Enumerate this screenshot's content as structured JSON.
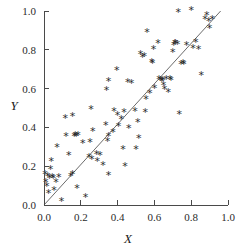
{
  "chart_data": {
    "type": "scatter",
    "title": "",
    "xlabel": "X",
    "ylabel": "Y",
    "xlim": [
      0.0,
      1.0
    ],
    "ylim": [
      0.0,
      1.0
    ],
    "grid": false,
    "legend": null,
    "marker_symbol": "*",
    "marker_color": "#2a2a2a",
    "xticks": [
      "0.0",
      "0.2",
      "0.4",
      "0.6",
      "0.8",
      "1.0"
    ],
    "xtick_values": [
      0.0,
      0.2,
      0.4,
      0.6,
      0.8,
      1.0
    ],
    "yticks": [
      "0.0",
      "0.2",
      "0.4",
      "0.6",
      "0.8",
      "1.0"
    ],
    "ytick_values": [
      0.0,
      0.2,
      0.4,
      0.6,
      0.8,
      1.0
    ],
    "fit_line": {
      "type": "line",
      "label": "",
      "color": "#5a5a5a",
      "x": [
        0.0,
        0.96
      ],
      "y": [
        0.0,
        1.0
      ],
      "slope": 1.04,
      "intercept": 0.0
    },
    "points": [
      [
        0.005,
        0.155
      ],
      [
        0.01,
        0.115
      ],
      [
        0.015,
        0.095
      ],
      [
        0.02,
        0.145
      ],
      [
        0.025,
        0.06
      ],
      [
        0.03,
        0.135
      ],
      [
        0.035,
        0.185
      ],
      [
        0.04,
        0.225
      ],
      [
        0.045,
        0.14
      ],
      [
        0.05,
        0.135
      ],
      [
        0.055,
        0.075
      ],
      [
        0.065,
        0.115
      ],
      [
        0.07,
        0.295
      ],
      [
        0.08,
        0.14
      ],
      [
        0.095,
        0.02
      ],
      [
        0.115,
        0.445
      ],
      [
        0.12,
        0.355
      ],
      [
        0.135,
        0.255
      ],
      [
        0.145,
        0.145
      ],
      [
        0.155,
        0.455
      ],
      [
        0.155,
        0.155
      ],
      [
        0.165,
        0.355
      ],
      [
        0.17,
        0.36
      ],
      [
        0.175,
        0.355
      ],
      [
        0.18,
        0.085
      ],
      [
        0.185,
        0.36
      ],
      [
        0.21,
        0.315
      ],
      [
        0.225,
        0.04
      ],
      [
        0.245,
        0.245
      ],
      [
        0.25,
        0.32
      ],
      [
        0.255,
        0.49
      ],
      [
        0.26,
        0.235
      ],
      [
        0.265,
        0.38
      ],
      [
        0.285,
        0.26
      ],
      [
        0.29,
        0.225
      ],
      [
        0.305,
        0.255
      ],
      [
        0.32,
        0.205
      ],
      [
        0.335,
        0.41
      ],
      [
        0.34,
        0.59
      ],
      [
        0.345,
        0.325
      ],
      [
        0.35,
        0.635
      ],
      [
        0.35,
        0.355
      ],
      [
        0.35,
        0.15
      ],
      [
        0.375,
        0.375
      ],
      [
        0.38,
        0.48
      ],
      [
        0.395,
        0.695
      ],
      [
        0.4,
        0.46
      ],
      [
        0.405,
        0.405
      ],
      [
        0.42,
        0.44
      ],
      [
        0.43,
        0.285
      ],
      [
        0.435,
        0.475
      ],
      [
        0.44,
        0.2
      ],
      [
        0.455,
        0.63
      ],
      [
        0.46,
        0.395
      ],
      [
        0.475,
        0.625
      ],
      [
        0.495,
        0.48
      ],
      [
        0.5,
        0.285
      ],
      [
        0.51,
        0.425
      ],
      [
        0.515,
        0.345
      ],
      [
        0.525,
        0.775
      ],
      [
        0.535,
        0.76
      ],
      [
        0.545,
        0.765
      ],
      [
        0.55,
        0.475
      ],
      [
        0.555,
        0.545
      ],
      [
        0.56,
        0.89
      ],
      [
        0.575,
        0.575
      ],
      [
        0.585,
        0.735
      ],
      [
        0.59,
        0.73
      ],
      [
        0.595,
        0.8
      ],
      [
        0.6,
        0.6
      ],
      [
        0.62,
        0.835
      ],
      [
        0.625,
        0.645
      ],
      [
        0.635,
        0.64
      ],
      [
        0.64,
        0.635
      ],
      [
        0.645,
        0.64
      ],
      [
        0.65,
        0.615
      ],
      [
        0.655,
        0.595
      ],
      [
        0.665,
        0.645
      ],
      [
        0.675,
        0.58
      ],
      [
        0.685,
        0.645
      ],
      [
        0.69,
        0.64
      ],
      [
        0.7,
        0.785
      ],
      [
        0.705,
        0.82
      ],
      [
        0.71,
        0.835
      ],
      [
        0.715,
        0.83
      ],
      [
        0.725,
        0.825
      ],
      [
        0.73,
        0.99
      ],
      [
        0.735,
        0.465
      ],
      [
        0.745,
        0.725
      ],
      [
        0.755,
        0.73
      ],
      [
        0.76,
        0.725
      ],
      [
        0.775,
        0.82
      ],
      [
        0.8,
        1.005
      ],
      [
        0.81,
        0.805
      ],
      [
        0.825,
        0.84
      ],
      [
        0.84,
        0.8
      ],
      [
        0.855,
        0.67
      ],
      [
        0.875,
        0.955
      ],
      [
        0.885,
        0.975
      ],
      [
        0.895,
        0.945
      ],
      [
        0.9,
        0.91
      ],
      [
        0.915,
        0.955
      ]
    ]
  },
  "axes": {
    "x_label": "X",
    "y_label": "Y"
  }
}
